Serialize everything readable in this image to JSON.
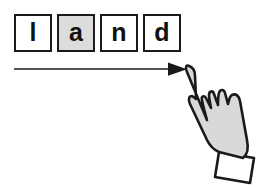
{
  "figure": {
    "name": "left-to-right-tracking-with-pointing-hand",
    "background_color": "#ffffff",
    "line_color": "#1a1a1a",
    "letters": [
      {
        "glyph": "l",
        "shaded": false,
        "highlight": false
      },
      {
        "glyph": "a",
        "shaded": true,
        "highlight": true
      },
      {
        "glyph": "n",
        "shaded": false,
        "highlight": false
      },
      {
        "glyph": "d",
        "shaded": false,
        "highlight": false
      }
    ],
    "word": "land",
    "highlight_color": "#dcdcdc",
    "arrow": {
      "name": "left-to-right-arrow",
      "direction": "right",
      "start_x": 14,
      "end_x": 186,
      "y": 69,
      "color": "#1a1a1a"
    },
    "hand": {
      "name": "pointing-hand",
      "gesture": "index-finger-pointing-up-left",
      "skin_fill": "#d9d9d9",
      "cuff_fill": "#ffffff",
      "outline_color": "#1a1a1a"
    }
  }
}
